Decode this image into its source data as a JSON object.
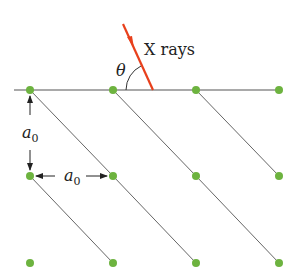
{
  "diagram": {
    "ray_label": "X rays",
    "angle_label": "θ",
    "spacing_label_vertical": "a",
    "spacing_label_vertical_sub": "0",
    "spacing_label_horizontal": "a",
    "spacing_label_horizontal_sub": "0",
    "colors": {
      "atom": "#6db33f",
      "ray": "#e8401c",
      "line": "#555555"
    },
    "lattice": {
      "columns_x": [
        30,
        113,
        196,
        279
      ],
      "rows_y": [
        90,
        176,
        263
      ]
    }
  }
}
